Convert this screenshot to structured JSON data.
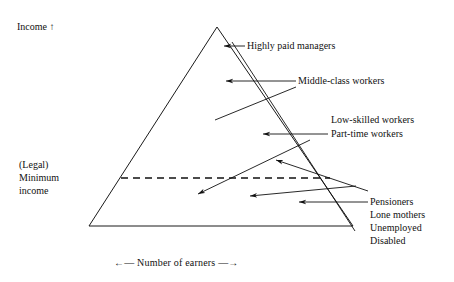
{
  "figure": {
    "type": "triangle-social-stratification-diagram",
    "axes": {
      "vertical_label": "Income ↑",
      "horizontal_label": "←— Number of earners —→",
      "horizontal_left_arrow": "←",
      "horizontal_right_arrow": "→",
      "vertical_arrow": "↑"
    },
    "threshold": {
      "label": "(Legal)\nMinimum\nincome",
      "line_style": "dashed"
    },
    "groups": [
      {
        "id": "managers",
        "label": "Highly paid managers"
      },
      {
        "id": "middle",
        "label": "Middle-class workers"
      },
      {
        "id": "lowskilled",
        "label": "Low-skilled workers"
      },
      {
        "id": "parttime",
        "label": "Part-time workers"
      },
      {
        "id": "bottom",
        "label": "Pensioners\nLone mothers\nUnemployed\nDisabled"
      }
    ],
    "colors": {
      "ink": "#111111",
      "background": "#ffffff"
    }
  }
}
